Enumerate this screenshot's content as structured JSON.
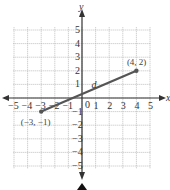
{
  "chart_data": {
    "type": "line",
    "title": "",
    "xlabel": "x",
    "ylabel": "y",
    "xlim": [
      -5,
      5
    ],
    "ylim": [
      -5,
      5
    ],
    "grid": true,
    "x_ticks": [
      "-5",
      "-4",
      "-3",
      "-2",
      "-1",
      "0",
      "1",
      "2",
      "3",
      "4",
      "5"
    ],
    "y_ticks": [
      "-5",
      "-4",
      "-3",
      "-2",
      "-1",
      "1",
      "2",
      "3",
      "4",
      "5"
    ],
    "series": [
      {
        "name": "d",
        "points": [
          [
            -3,
            -1
          ],
          [
            4,
            2
          ]
        ]
      }
    ],
    "annotations": [
      {
        "text": "(4, 2)",
        "x": 4,
        "y": 2
      },
      {
        "text": "(−3, −1)",
        "x": -3,
        "y": -1
      },
      {
        "text": "d",
        "x": 0.5,
        "y": 1
      }
    ],
    "colors": {
      "segment": "#555555",
      "grid": "#b0b0b0",
      "axis": "#333333"
    }
  },
  "labels": {
    "x_axis": "x",
    "y_axis": "y",
    "origin": "0",
    "segment": "d",
    "point_a": "(4, 2)",
    "point_b": "(−3, −1)"
  }
}
